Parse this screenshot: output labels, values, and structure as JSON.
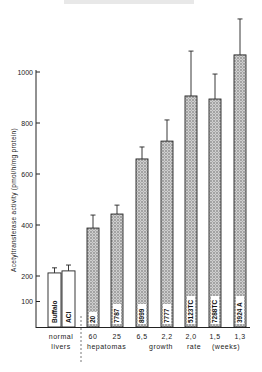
{
  "chart_data": {
    "type": "bar",
    "title": "",
    "ylabel": "Acetyltransferase activity (pmol/h/mg protein)",
    "xlabel": "growth rate (weeks)",
    "ylim": [
      0,
      1000
    ],
    "yticks": [
      100,
      200,
      400,
      600,
      800,
      1000
    ],
    "grid": false,
    "groups": [
      {
        "name": "normal livers",
        "categories": [
          "Buffalo",
          "ACI"
        ]
      },
      {
        "name": "hepatomas",
        "categories": [
          "20",
          "7787",
          "8999",
          "7777",
          "5123TC",
          "7288TC",
          "3924 A"
        ]
      }
    ],
    "categories": [
      "Buffalo",
      "ACI",
      "20",
      "7787",
      "8999",
      "7777",
      "5123TC",
      "7288TC",
      "3924 A"
    ],
    "growth_rate_weeks": [
      "",
      "",
      "60",
      "25",
      "6,5",
      "2,2",
      "2,0",
      "1,5",
      "1,3"
    ],
    "values": [
      212,
      220,
      388,
      443,
      659,
      729,
      906,
      894,
      1067
    ],
    "error_upper": [
      232,
      243,
      439,
      478,
      706,
      812,
      1082,
      992,
      1208
    ],
    "fill": [
      "white",
      "white",
      "stippled",
      "stippled",
      "stippled",
      "stippled",
      "stippled",
      "stippled",
      "stippled"
    ]
  },
  "axis": {
    "ylabel": "Acetyltransferase activity (pmol/h/mg protein)",
    "ticks": [
      "100",
      "200",
      "400",
      "600",
      "800",
      "1000"
    ]
  },
  "xaxis": {
    "normal_line1": "normal",
    "normal_line2": "livers",
    "rates": [
      "60",
      "25",
      "6,5",
      "2,2",
      "2,0",
      "1,5",
      "1,3"
    ],
    "hepatomas": "hepatomas",
    "growth": "growth",
    "rate": "rate",
    "weeks": "(weeks)"
  },
  "bars": [
    "Buffalo",
    "ACI",
    "20",
    "7787",
    "8999",
    "7777",
    "5123TC",
    "7288TC",
    "3924 A"
  ]
}
